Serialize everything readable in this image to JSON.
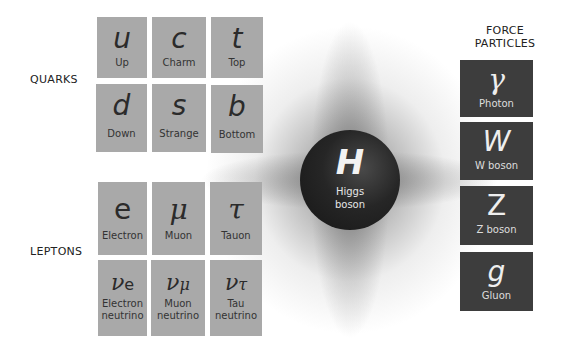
{
  "glow": {
    "color": "#555555"
  },
  "groups": {
    "quarks_label": "QUARKS",
    "leptons_label": "LEPTONS",
    "force_label_line1": "FORCE",
    "force_label_line2": "PARTICLES"
  },
  "quarks": [
    {
      "symbol": "u",
      "name": "Up"
    },
    {
      "symbol": "c",
      "name": "Charm"
    },
    {
      "symbol": "t",
      "name": "Top"
    },
    {
      "symbol": "d",
      "name": "Down"
    },
    {
      "symbol": "s",
      "name": "Strange"
    },
    {
      "symbol": "b",
      "name": "Bottom"
    }
  ],
  "leptons": [
    {
      "symbol": "e",
      "name": "Electron"
    },
    {
      "symbol": "μ",
      "name": "Muon"
    },
    {
      "symbol": "τ",
      "name": "Tauon"
    },
    {
      "symbol": "ν",
      "subscript": "e",
      "name_line1": "Electron",
      "name_line2": "neutrino"
    },
    {
      "symbol": "ν",
      "subscript": "μ",
      "name_line1": "Muon",
      "name_line2": "neutrino"
    },
    {
      "symbol": "ν",
      "subscript": "τ",
      "name_line1": "Tau",
      "name_line2": "neutrino"
    }
  ],
  "force_particles": [
    {
      "symbol": "γ",
      "name": "Photon"
    },
    {
      "symbol": "W",
      "name": "W boson"
    },
    {
      "symbol": "Z",
      "name": "Z boson"
    },
    {
      "symbol": "g",
      "name": "Gluon"
    }
  ],
  "higgs": {
    "symbol": "H",
    "name_line1": "Higgs",
    "name_line2": "boson"
  },
  "colors": {
    "fermion_box": "#a9a9a9",
    "boson_box": "#3d3d3d",
    "higgs_sphere": "#1e1e1e"
  }
}
